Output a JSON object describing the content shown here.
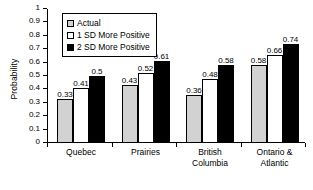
{
  "chart_data": {
    "type": "bar",
    "title": "",
    "xlabel": "",
    "ylabel": "Probability",
    "ylim": [
      0,
      1
    ],
    "ytick_labels": [
      "0",
      "0.1",
      "0.2",
      "0.3",
      "0.4",
      "0.5",
      "0.6",
      "0.7",
      "0.8",
      "0.9",
      "1"
    ],
    "ytick_values": [
      0,
      0.1,
      0.2,
      0.3,
      0.4,
      0.5,
      0.6,
      0.7,
      0.8,
      0.9,
      1
    ],
    "grid": false,
    "legend_position": "upper-left-inside",
    "categories": [
      "Quebec",
      "Prairies",
      "British\nColumbia",
      "Ontario &\nAtlantic"
    ],
    "series": [
      {
        "name": "Actual",
        "color": "#d2d2d2",
        "values": [
          0.33,
          0.43,
          0.36,
          0.58
        ],
        "labels": [
          "0.33",
          "0.43",
          "0.36",
          "0.58"
        ]
      },
      {
        "name": "1 SD More Positive",
        "color": "#ffffff",
        "values": [
          0.41,
          0.52,
          0.48,
          0.66
        ],
        "labels": [
          "0.41",
          "0.52",
          "0.48",
          "0.66"
        ]
      },
      {
        "name": "2 SD More Positive",
        "color": "#000000",
        "values": [
          0.5,
          0.61,
          0.58,
          0.74
        ],
        "labels": [
          "0.5",
          "0.61",
          "0.58",
          "0.74"
        ]
      }
    ]
  }
}
